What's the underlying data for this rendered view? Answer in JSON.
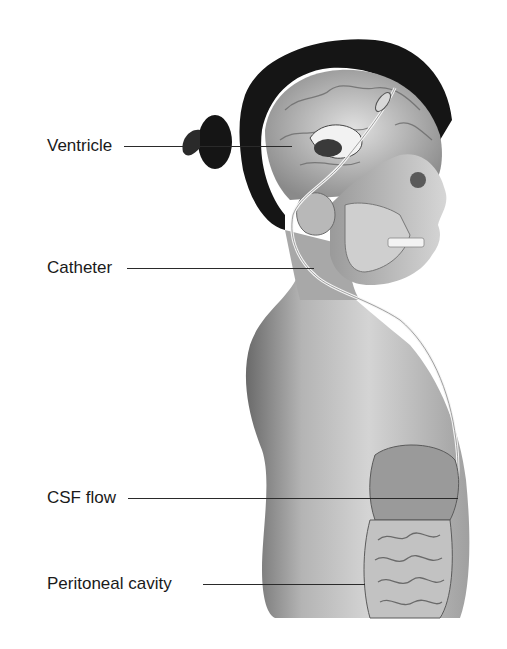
{
  "figure": {
    "colors": {
      "background": "#ffffff",
      "hair": "#151515",
      "skin_light": "#d8d8d8",
      "skin_mid": "#a8a8a8",
      "skin_dark": "#6a6a6a",
      "label_text": "#1a1a1a",
      "leader_line": "#2a2a2a"
    }
  },
  "labels": [
    {
      "id": "ventricle",
      "text": "Ventricle"
    },
    {
      "id": "catheter",
      "text": "Catheter"
    },
    {
      "id": "csf-flow",
      "text": "CSF flow"
    },
    {
      "id": "peritoneal-cavity",
      "text": "Peritoneal cavity"
    }
  ]
}
